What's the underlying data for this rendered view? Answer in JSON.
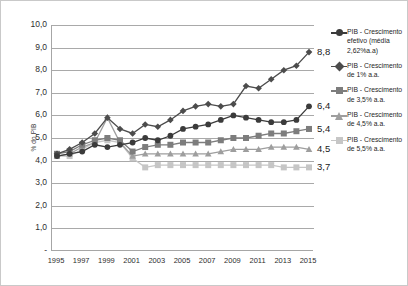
{
  "chart": {
    "type": "line",
    "ylabel": "% do PIB",
    "y_ticks": [
      "10,0",
      "9,0",
      "8,0",
      "7,0",
      "6,0",
      "5,0",
      "4,0",
      "3,0",
      "2,0",
      "1,0",
      "-"
    ],
    "x_ticks": [
      "1995",
      "1997",
      "1999",
      "2001",
      "2003",
      "2005",
      "2007",
      "2009",
      "2011",
      "2013",
      "2015"
    ]
  },
  "legend": {
    "items": [
      {
        "label": "PIB - Crescimento efetivo (média 2,62%a.a)",
        "marker": "circle-marker",
        "color": "#3b3b3b"
      },
      {
        "label": "PIB - Crescimento de 1% a.a.",
        "marker": "diamond-marker",
        "color": "#4c4c4c"
      },
      {
        "label": "PIB - Crescimento de 3,5% a.a.",
        "marker": "square-marker",
        "color": "#7d7d7d"
      },
      {
        "label": "PIB - Crescimento de 4,5% a.a.",
        "marker": "triangle-marker",
        "color": "#9e9e9e"
      },
      {
        "label": "PIB - Crescimento de 5,5% a.a.",
        "marker": "light-square-marker",
        "color": "#c6c6c6"
      }
    ]
  },
  "end_labels": [
    {
      "text": "8,8",
      "value": 8.8
    },
    {
      "text": "6,4",
      "value": 6.4
    },
    {
      "text": "5,4",
      "value": 5.4
    },
    {
      "text": "4,5",
      "value": 4.5
    },
    {
      "text": "3,7",
      "value": 3.7
    }
  ],
  "chart_data": {
    "type": "line",
    "title": "",
    "xlabel": "",
    "ylabel": "% do PIB",
    "xlim": [
      1995,
      2015
    ],
    "ylim": [
      0,
      10
    ],
    "grid": true,
    "legend_position": "right",
    "x": [
      1995,
      1996,
      1997,
      1998,
      1999,
      2000,
      2001,
      2002,
      2003,
      2004,
      2005,
      2006,
      2007,
      2008,
      2009,
      2010,
      2011,
      2012,
      2013,
      2014,
      2015
    ],
    "series": [
      {
        "name": "PIB - Crescimento efetivo (média 2,62%a.a)",
        "marker": "circle",
        "color": "#3b3b3b",
        "end_label": "6,4",
        "values": [
          4.2,
          4.3,
          4.4,
          4.7,
          4.6,
          4.7,
          4.8,
          5.0,
          4.9,
          5.1,
          5.4,
          5.5,
          5.6,
          5.8,
          6.0,
          5.9,
          5.8,
          5.7,
          5.7,
          5.8,
          6.4
        ]
      },
      {
        "name": "PIB - Crescimento de 1% a.a.",
        "marker": "diamond",
        "color": "#4c4c4c",
        "end_label": "8,8",
        "values": [
          4.3,
          4.5,
          4.8,
          5.2,
          5.9,
          5.4,
          5.2,
          5.6,
          5.5,
          5.8,
          6.2,
          6.4,
          6.5,
          6.4,
          6.5,
          7.3,
          7.2,
          7.6,
          8.0,
          8.2,
          8.8
        ]
      },
      {
        "name": "PIB - Crescimento de 3,5% a.a.",
        "marker": "square",
        "color": "#7d7d7d",
        "end_label": "5,4",
        "values": [
          4.3,
          4.4,
          4.7,
          4.9,
          5.0,
          4.9,
          4.4,
          4.6,
          4.7,
          4.7,
          4.8,
          4.8,
          4.8,
          4.9,
          5.0,
          5.0,
          5.1,
          5.2,
          5.2,
          5.3,
          5.4
        ]
      },
      {
        "name": "PIB - Crescimento de 4,5% a.a.",
        "marker": "triangle",
        "color": "#9e9e9e",
        "end_label": "4,5",
        "values": [
          4.2,
          4.3,
          4.6,
          4.8,
          5.9,
          4.8,
          4.2,
          4.3,
          4.3,
          4.3,
          4.3,
          4.3,
          4.3,
          4.4,
          4.5,
          4.5,
          4.5,
          4.6,
          4.6,
          4.6,
          4.5
        ]
      },
      {
        "name": "PIB - Crescimento de 5,5% a.a.",
        "marker": "light-square",
        "color": "#c6c6c6",
        "end_label": "3,7",
        "values": [
          4.2,
          4.2,
          4.5,
          4.8,
          4.9,
          4.8,
          4.1,
          3.7,
          3.8,
          3.8,
          3.8,
          3.8,
          3.8,
          3.8,
          3.8,
          3.8,
          3.8,
          3.8,
          3.7,
          3.7,
          3.7
        ]
      }
    ]
  }
}
